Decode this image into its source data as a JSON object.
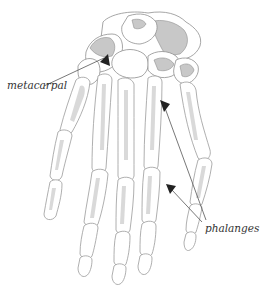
{
  "diagram": {
    "labels": [
      {
        "id": "metacarpal",
        "text": "metacarpal",
        "arrow_count": 1
      },
      {
        "id": "phalanges",
        "text": "phalanges",
        "arrow_count": 2
      }
    ],
    "colors": {
      "background": "#ffffff",
      "bone_fill": "#ffffff",
      "bone_shade": "#d9d9d9",
      "bone_outline": "#9a9a9a",
      "carpal_shade": "#c8c8c8",
      "arrow": "#222222",
      "leader_line": "#555555",
      "label_text": "#333333"
    }
  }
}
